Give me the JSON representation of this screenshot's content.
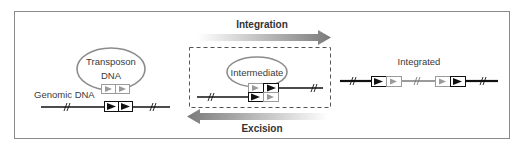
{
  "labels": {
    "transposon_line1": "Transposon",
    "transposon_line2": "DNA",
    "genomic_dna": "Genomic DNA",
    "intermediate": "Intermediate",
    "integrated": "Integrated",
    "integration": "Integration",
    "excision": "Excision"
  },
  "colors": {
    "frame": "#8a8a8a",
    "dna_black": "#111111",
    "dna_gray": "#9a9a9a",
    "arrow_gray": "#7a7a7a",
    "ellipse_gray": "#8c8c8c"
  }
}
